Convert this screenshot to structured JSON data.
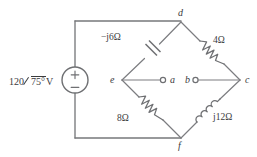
{
  "diagram": {
    "background_color": "#ffffff",
    "line_color": "#77787b",
    "text_color": "#3b3b3d"
  },
  "source": {
    "name": "independent-voltage-source",
    "magnitude": "120",
    "phase": "75°",
    "unit": "V",
    "label": "120∠75°V",
    "polarity_top": "+",
    "polarity_bottom": "−"
  },
  "components": [
    {
      "id": "capacitor-upper-left",
      "type": "capacitor",
      "label": "−j6Ω",
      "branch": "e-d"
    },
    {
      "id": "resistor-upper-right",
      "type": "resistor",
      "label": "4Ω",
      "branch": "d-c"
    },
    {
      "id": "resistor-lower-left",
      "type": "resistor",
      "label": "8Ω",
      "branch": "e-f"
    },
    {
      "id": "inductor-lower-right",
      "type": "inductor",
      "label": "j12Ω",
      "branch": "f-c"
    }
  ],
  "nodes": [
    {
      "id": "d",
      "label": "d",
      "type": "junction"
    },
    {
      "id": "e",
      "label": "e",
      "type": "junction"
    },
    {
      "id": "a",
      "label": "a",
      "type": "open-terminal"
    },
    {
      "id": "b",
      "label": "b",
      "type": "open-terminal"
    },
    {
      "id": "c",
      "label": "c",
      "type": "junction"
    },
    {
      "id": "f",
      "label": "f",
      "type": "junction"
    }
  ]
}
